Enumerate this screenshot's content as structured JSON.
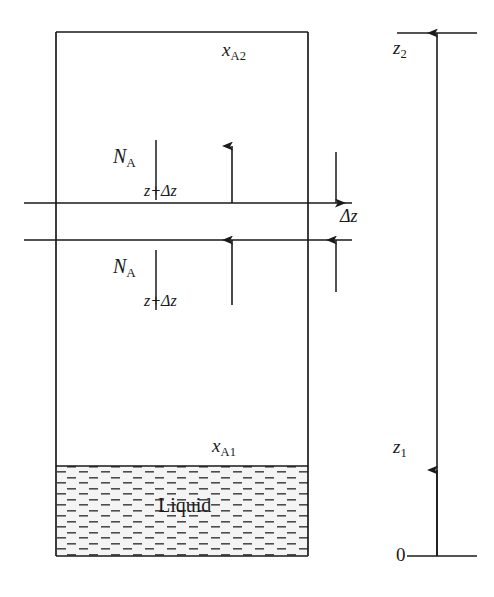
{
  "figure": {
    "background_color": "#ffffff",
    "line_color": "#1a1a1a",
    "liquid_fill_color": "#f2f2f2",
    "liquid_hatch_color": "#555555",
    "width": 494,
    "height": 597
  },
  "labels": {
    "x_a2": {
      "symbol": "x",
      "subscript": "A2"
    },
    "x_a1": {
      "symbol": "x",
      "subscript": "A1"
    },
    "flux_upper": {
      "symbol": "N",
      "subscript": "A",
      "evaluated_at": "z+Δz"
    },
    "flux_lower": {
      "symbol": "N",
      "subscript": "A",
      "evaluated_at": "z+Δz"
    },
    "delta_z": "Δz",
    "z_top": {
      "symbol": "z",
      "subscript": "2"
    },
    "z_bottom": {
      "symbol": "z",
      "subscript": "1"
    },
    "origin": "0",
    "liquid": "Liquid"
  },
  "geometry": {
    "container": {
      "left": 56,
      "top": 32,
      "right": 308,
      "bottom": 556
    },
    "liquid_surface_y": 466,
    "control_volume": {
      "upper_line_y": 203,
      "lower_line_y": 240
    },
    "flux_arrow_x": 232,
    "axis_x": 437,
    "axis_top_y": 33,
    "axis_bottom_y": 556,
    "z1_arrow_tail_y": 556,
    "z1_arrow_head_y": 470,
    "z2_arrow_tail_y": 556,
    "z2_arrow_head_y": 33
  }
}
